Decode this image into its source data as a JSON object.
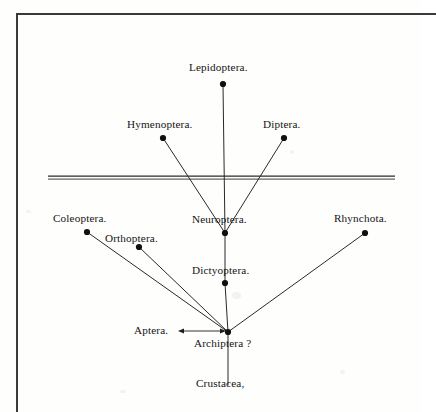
{
  "figure": {
    "type": "phylogenetic-tree-diagram",
    "background_color": "#fefefd",
    "ink_color": "#141414",
    "frame_color": "#3a3a3a"
  },
  "nodes": [
    {
      "id": "lepidoptera",
      "label": "Lepidoptera.",
      "x": 223,
      "y": 84,
      "label_x": 189,
      "label_y": 62,
      "dot": true
    },
    {
      "id": "hymenoptera",
      "label": "Hymenoptera.",
      "x": 163,
      "y": 138,
      "label_x": 127,
      "label_y": 119,
      "dot": true
    },
    {
      "id": "diptera",
      "label": "Diptera.",
      "x": 284,
      "y": 138,
      "label_x": 263,
      "label_y": 119,
      "dot": true
    },
    {
      "id": "coleoptera",
      "label": "Coleoptera.",
      "x": 87,
      "y": 232,
      "label_x": 53,
      "label_y": 213,
      "dot": true
    },
    {
      "id": "neuroptera",
      "label": "Neuroptera.",
      "x": 225,
      "y": 233,
      "label_x": 192,
      "label_y": 214,
      "dot": true
    },
    {
      "id": "rhynchota",
      "label": "Rhynchota.",
      "x": 365,
      "y": 233,
      "label_x": 334,
      "label_y": 213,
      "dot": true
    },
    {
      "id": "orthoptera",
      "label": "Orthoptera.",
      "x": 139,
      "y": 247,
      "label_x": 105,
      "label_y": 233,
      "dot": true
    },
    {
      "id": "dictyoptera",
      "label": "Dictyoptera.",
      "x": 225,
      "y": 283,
      "label_x": 192,
      "label_y": 265,
      "dot": true
    },
    {
      "id": "archiptera",
      "label": "Archiptera ?",
      "x": 228,
      "y": 332,
      "label_x": 194,
      "label_y": 338,
      "dot": true
    },
    {
      "id": "aptera",
      "label": "Aptera.",
      "x": 170,
      "y": 331,
      "label_x": 134,
      "label_y": 325,
      "dot": false
    },
    {
      "id": "crustacea",
      "label": "Crustacea,",
      "x": 228,
      "y": 385,
      "label_x": 196,
      "label_y": 378,
      "dot": false
    }
  ],
  "branches": [
    {
      "id": "lepidoptera-neuroptera",
      "from": "lepidoptera",
      "to": "neuroptera"
    },
    {
      "id": "hymenoptera-neuroptera",
      "from": "hymenoptera",
      "to": "neuroptera"
    },
    {
      "id": "diptera-neuroptera",
      "from": "diptera",
      "to": "neuroptera"
    },
    {
      "id": "neuroptera-dictyoptera",
      "from": "neuroptera",
      "to": "dictyoptera"
    },
    {
      "id": "dictyoptera-archiptera",
      "from": "dictyoptera",
      "to": "archiptera"
    },
    {
      "id": "coleoptera-archiptera",
      "from": "coleoptera",
      "to": "archiptera"
    },
    {
      "id": "orthoptera-archiptera",
      "from": "orthoptera",
      "to": "archiptera"
    },
    {
      "id": "rhynchota-archiptera",
      "from": "rhynchota",
      "to": "archiptera"
    },
    {
      "id": "archiptera-crustacea",
      "from": "archiptera",
      "to": "crustacea"
    }
  ],
  "arrow": {
    "id": "aptera-archiptera-arrow",
    "x1": 178,
    "x2": 226,
    "y": 331,
    "double_headed": true
  },
  "horizontal_rule": {
    "id": "stratum-line",
    "x1": 48,
    "x2": 395,
    "y": 178,
    "style": "double-rule"
  }
}
